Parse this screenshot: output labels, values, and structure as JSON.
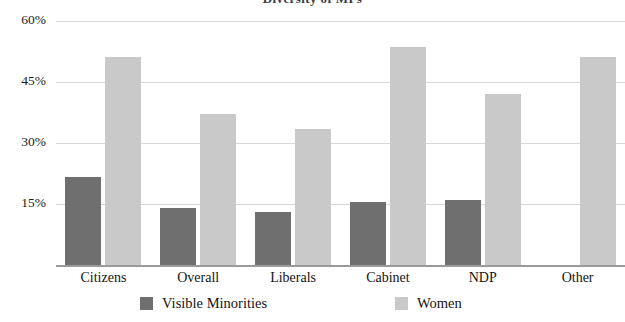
{
  "chart_data": {
    "type": "bar",
    "title": "Diversity of MPs",
    "xlabel": "",
    "ylabel": "",
    "ylim": [
      0,
      60
    ],
    "yticks": [
      15,
      30,
      45,
      60
    ],
    "ytick_labels": [
      "15%",
      "30%",
      "45%",
      "60%"
    ],
    "grid": true,
    "legend_position": "bottom",
    "categories": [
      "Citizens",
      "Overall",
      "Liberals",
      "Cabinet",
      "NDP",
      "Other"
    ],
    "series": [
      {
        "name": "Visible Minorities",
        "color": "#6f6f6f",
        "values": [
          21.5,
          14.0,
          13.0,
          15.5,
          16.0,
          null
        ]
      },
      {
        "name": "Women",
        "color": "#c9c9c9",
        "values": [
          51.0,
          37.0,
          33.5,
          53.5,
          42.0,
          51.0
        ]
      }
    ]
  },
  "legend": [
    {
      "label": "Visible Minorities",
      "swatch": "vm"
    },
    {
      "label": "Women",
      "swatch": "women"
    }
  ]
}
